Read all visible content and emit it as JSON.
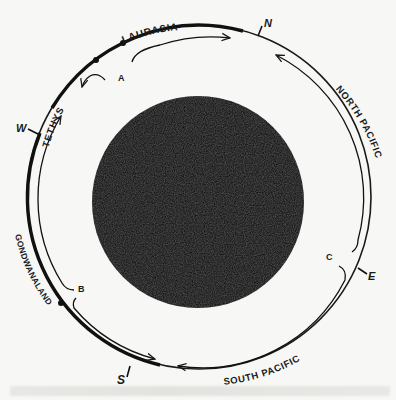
{
  "diagram": {
    "type": "circular schematic of ocean currents around a globe",
    "center_disk": {
      "cx": 198,
      "cy": 202,
      "r": 106,
      "color": "#111111"
    },
    "outer_circle": {
      "cx": 199,
      "cy": 197,
      "r": 172
    },
    "inner_track": {
      "cx": 199,
      "cy": 197,
      "r": 160
    },
    "compass": [
      {
        "label": "N",
        "angle": 20
      },
      {
        "label": "E",
        "angle": 112
      },
      {
        "label": "S",
        "angle": 200
      },
      {
        "label": "W",
        "angle": 290
      }
    ],
    "regions": {
      "laurasia": "LAURASIA",
      "tethys": "TETHYS",
      "north_pacific": "NORTH PACIFIC",
      "north": "NORTH",
      "pacific_n": "PACIFIC",
      "south_pacific": "SOUTH PACIFIC",
      "south": "SOUTH",
      "pacific_s": "PACIFIC",
      "gondwanaland": "GONDWANALAND"
    },
    "points": {
      "a": "A",
      "b": "B",
      "c": "C"
    },
    "compass_labels": {
      "n": "N",
      "e": "E",
      "s": "S",
      "w": "W"
    }
  },
  "caption": {
    "text": ""
  }
}
